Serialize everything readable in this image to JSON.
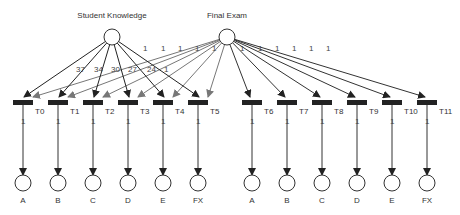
{
  "diagram": {
    "type": "petri-net",
    "colors": {
      "arc_dark": "#222222",
      "arc_gray": "#666666",
      "transition": "#222222",
      "place_stroke": "#333333"
    },
    "sources": [
      {
        "id": "student_knowledge",
        "label": "Student Knowledge",
        "x": 112,
        "y": 37
      },
      {
        "id": "final_exam",
        "label": "Final Exam",
        "x": 227,
        "y": 37
      }
    ],
    "transitions": [
      {
        "label": "T0",
        "x": 25
      },
      {
        "label": "T1",
        "x": 60
      },
      {
        "label": "T2",
        "x": 95
      },
      {
        "label": "T3",
        "x": 130
      },
      {
        "label": "T4",
        "x": 165
      },
      {
        "label": "T5",
        "x": 200
      },
      {
        "label": "T6",
        "x": 254
      },
      {
        "label": "T7",
        "x": 289
      },
      {
        "label": "T8",
        "x": 324
      },
      {
        "label": "T9",
        "x": 359
      },
      {
        "label": "T10",
        "x": 394
      },
      {
        "label": "T11",
        "x": 429
      }
    ],
    "outputs": [
      {
        "label": "A"
      },
      {
        "label": "B"
      },
      {
        "label": "C"
      },
      {
        "label": "D"
      },
      {
        "label": "E"
      },
      {
        "label": "FX"
      },
      {
        "label": "A"
      },
      {
        "label": "B"
      },
      {
        "label": "C"
      },
      {
        "label": "D"
      },
      {
        "label": "E"
      },
      {
        "label": "FX"
      }
    ],
    "sk_weights": [
      "37",
      "34",
      "30",
      "27",
      "24",
      "1"
    ],
    "fe_weights_left": [
      "1",
      "1",
      "1",
      "1",
      "1"
    ],
    "fe_weights_right": [
      "1",
      "1",
      "1",
      "1",
      "1",
      "1"
    ],
    "output_arc_weight": "1"
  }
}
